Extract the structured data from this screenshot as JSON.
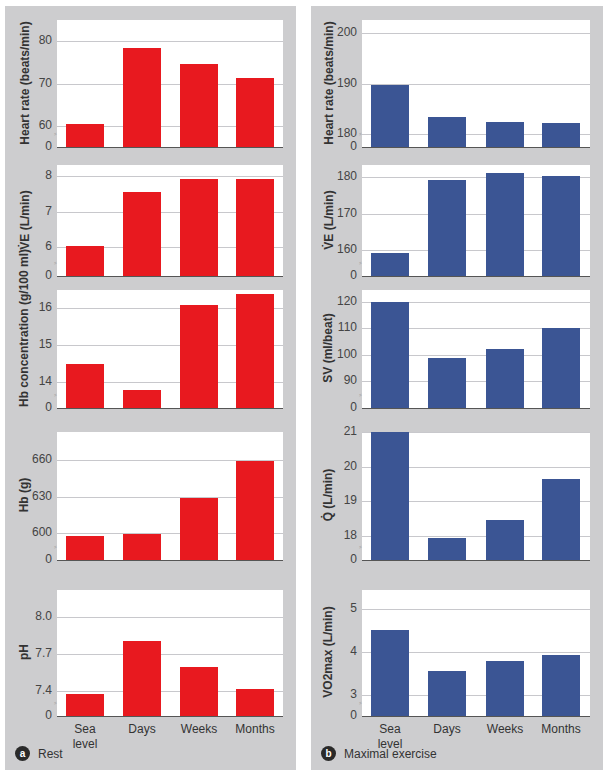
{
  "categories": [
    "Sea\nlevel",
    "Days",
    "Weeks",
    "Months"
  ],
  "colors": {
    "rest": "#e8191f",
    "exercise": "#3b5594",
    "panel_bg": "#cdcdcf"
  },
  "panels": {
    "a": {
      "badge": "a",
      "caption": "Rest"
    },
    "b": {
      "badge": "b",
      "caption": "Maximal exercise"
    }
  },
  "chart_data": [
    {
      "type": "bar",
      "panel": "a",
      "title": "",
      "ylabel": "Heart rate (beats/min)",
      "categories": [
        "Sea level",
        "Days",
        "Weeks",
        "Months"
      ],
      "yticks": [
        "0",
        "60",
        "70",
        "80"
      ],
      "axis_break": true,
      "ylim": [
        55,
        85
      ],
      "values": [
        60.5,
        78.5,
        74.5,
        71.2
      ]
    },
    {
      "type": "bar",
      "panel": "a",
      "title": "",
      "ylabel": "V̇E (L/min)",
      "categories": [
        "Sea level",
        "Days",
        "Weeks",
        "Months"
      ],
      "yticks": [
        "0",
        "6",
        "7",
        "8"
      ],
      "axis_break": true,
      "ylim": [
        5.2,
        8.3
      ],
      "values": [
        6.05,
        7.55,
        7.9,
        7.9
      ]
    },
    {
      "type": "bar",
      "panel": "a",
      "title": "",
      "ylabel": "Hb concentration (g/100 ml)",
      "categories": [
        "Sea level",
        "Days",
        "Weeks",
        "Months"
      ],
      "yticks": [
        "0",
        "14",
        "15",
        "16"
      ],
      "axis_break": true,
      "ylim": [
        13.3,
        16.5
      ],
      "values": [
        14.5,
        13.8,
        16.1,
        16.4
      ]
    },
    {
      "type": "bar",
      "panel": "a",
      "title": "",
      "ylabel": "Hb (g)",
      "categories": [
        "Sea level",
        "Days",
        "Weeks",
        "Months"
      ],
      "yticks": [
        "0",
        "600",
        "630",
        "660"
      ],
      "axis_break": true,
      "ylim": [
        578,
        683
      ],
      "values": [
        598,
        599,
        629,
        659
      ]
    },
    {
      "type": "bar",
      "panel": "a",
      "title": "",
      "ylabel": "pH",
      "categories": [
        "Sea level",
        "Days",
        "Weeks",
        "Months"
      ],
      "yticks": [
        "0",
        "7.4",
        "7.7",
        "8.0"
      ],
      "axis_break": true,
      "ylim": [
        7.2,
        8.22
      ],
      "values": [
        7.38,
        7.81,
        7.6,
        7.42
      ]
    },
    {
      "type": "bar",
      "panel": "b",
      "title": "",
      "ylabel": "Heart rate (beats/min)",
      "categories": [
        "Sea level",
        "Days",
        "Weeks",
        "Months"
      ],
      "yticks": [
        "0",
        "180",
        "190",
        "200"
      ],
      "axis_break": true,
      "ylim": [
        177.5,
        202.5
      ],
      "values": [
        189.8,
        183.5,
        182.5,
        182.2
      ]
    },
    {
      "type": "bar",
      "panel": "b",
      "title": "",
      "ylabel": "V̇E (L/min)",
      "categories": [
        "Sea level",
        "Days",
        "Weeks",
        "Months"
      ],
      "yticks": [
        "0",
        "160",
        "170",
        "180"
      ],
      "axis_break": true,
      "ylim": [
        152.9,
        183.3
      ],
      "values": [
        159.3,
        179.2,
        181.0,
        180.2
      ]
    },
    {
      "type": "bar",
      "panel": "b",
      "title": "",
      "ylabel": "SV (ml/beat)",
      "categories": [
        "Sea level",
        "Days",
        "Weeks",
        "Months"
      ],
      "yticks": [
        "0",
        "90",
        "100",
        "110",
        "120"
      ],
      "axis_break": true,
      "ylim": [
        79.6,
        124.6
      ],
      "values": [
        120,
        98.5,
        102,
        110
      ]
    },
    {
      "type": "bar",
      "panel": "b",
      "title": "",
      "ylabel": "Q̇ (L/min)",
      "categories": [
        "Sea level",
        "Days",
        "Weeks",
        "Months"
      ],
      "yticks": [
        "0",
        "18",
        "19",
        "20",
        "21"
      ],
      "axis_break": true,
      "ylim": [
        17.3,
        21.0
      ],
      "values": [
        21.0,
        17.95,
        18.45,
        19.65
      ]
    },
    {
      "type": "bar",
      "panel": "b",
      "title": "",
      "ylabel": "VO2max (L/min)",
      "categories": [
        "Sea level",
        "Days",
        "Weeks",
        "Months"
      ],
      "yticks": [
        "0",
        "3",
        "4",
        "5"
      ],
      "axis_break": true,
      "ylim": [
        2.5,
        5.45
      ],
      "values": [
        4.52,
        3.55,
        3.78,
        3.94
      ]
    }
  ]
}
